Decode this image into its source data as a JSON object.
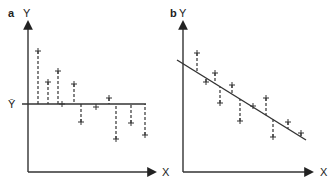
{
  "chart_data": [
    {
      "type": "scatter",
      "panel_label": "a",
      "title": "",
      "xlabel": "X",
      "ylabel": "Y",
      "reference_line": {
        "kind": "horizontal_mean",
        "label": "Ȳ",
        "y": 104
      },
      "residual_style": "dashed vertical lines from points to mean line",
      "grid": false,
      "points": [
        {
          "x": 38,
          "y": 51
        },
        {
          "x": 48,
          "y": 82
        },
        {
          "x": 58,
          "y": 71
        },
        {
          "x": 62,
          "y": 104
        },
        {
          "x": 74,
          "y": 84
        },
        {
          "x": 81,
          "y": 122
        },
        {
          "x": 96,
          "y": 107
        },
        {
          "x": 109,
          "y": 98
        },
        {
          "x": 116,
          "y": 139
        },
        {
          "x": 131,
          "y": 123
        },
        {
          "x": 145,
          "y": 135
        }
      ],
      "coordinate_note": "pixel coordinates, y increases downward"
    },
    {
      "type": "scatter",
      "panel_label": "b",
      "title": "",
      "xlabel": "X",
      "ylabel": "Y",
      "reference_line": {
        "kind": "regression_line",
        "x1": 177,
        "y1": 60,
        "x2": 306,
        "y2": 140
      },
      "residual_style": "dashed vertical lines from points to regression line",
      "grid": false,
      "points": [
        {
          "x": 197,
          "y": 53
        },
        {
          "x": 206,
          "y": 82
        },
        {
          "x": 215,
          "y": 73
        },
        {
          "x": 220,
          "y": 103
        },
        {
          "x": 232,
          "y": 85
        },
        {
          "x": 240,
          "y": 121
        },
        {
          "x": 253,
          "y": 106
        },
        {
          "x": 266,
          "y": 98
        },
        {
          "x": 273,
          "y": 137
        },
        {
          "x": 288,
          "y": 122
        },
        {
          "x": 301,
          "y": 133
        }
      ],
      "coordinate_note": "pixel coordinates, y increases downward"
    }
  ],
  "labels": {
    "panel_a": "a",
    "panel_b": "b",
    "y_axis": "Y",
    "x_axis": "X",
    "y_bar": "Ȳ"
  },
  "colors": {
    "ink": "#333333",
    "background": "#ffffff"
  }
}
